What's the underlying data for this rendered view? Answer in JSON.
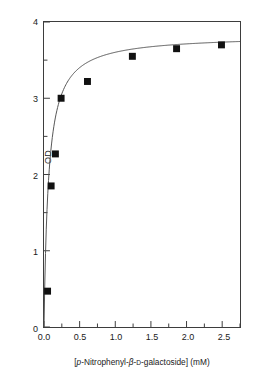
{
  "chart_data": {
    "type": "scatter",
    "title": "",
    "subtitle": "",
    "xlabel_parts": {
      "open_bracket": "[",
      "p_italic": "p",
      "nitrophenyl": "-Nitrophenyl-",
      "beta": "β",
      "dash1": "-",
      "d_smallcap": "D",
      "galactoside": "-galactoside]",
      "units": " (mM)"
    },
    "xlabel": "[p-Nitrophenyl-β-D-galactoside] (mM)",
    "ylabel": "OD",
    "xlim": [
      0.0,
      2.75
    ],
    "ylim": [
      0.0,
      4.0
    ],
    "xticks": [
      0.0,
      0.5,
      1.0,
      1.5,
      2.0,
      2.5
    ],
    "xtick_labels": [
      "0.0",
      "0.5",
      "1.0",
      "1.5",
      "2.0",
      "2.5"
    ],
    "x_minor_ticks": [
      0.25,
      0.75,
      1.25,
      1.75,
      2.25,
      2.75
    ],
    "yticks": [
      0,
      1,
      2,
      3,
      4
    ],
    "ytick_labels": [
      "0",
      "1",
      "2",
      "3",
      "4"
    ],
    "y_minor_ticks": [
      0.5,
      1.5,
      2.5,
      3.5
    ],
    "grid": false,
    "legend": false,
    "legend_position": "none",
    "marker_style": "filled-square",
    "marker_color": "#111111",
    "line_color": "#555555",
    "axis_color": "#3d3d3d",
    "background_color": "#ffffff",
    "x": [
      0.05,
      0.1,
      0.16,
      0.24,
      0.61,
      1.24,
      1.86,
      2.49
    ],
    "y": [
      0.47,
      1.85,
      2.27,
      3.0,
      3.22,
      3.55,
      3.65,
      3.7
    ],
    "series": [
      {
        "name": "OD",
        "x": [
          0.05,
          0.1,
          0.16,
          0.24,
          0.61,
          1.24,
          1.86,
          2.49
        ],
        "values": [
          0.47,
          1.85,
          2.27,
          3.0,
          3.22,
          3.55,
          3.65,
          3.7
        ]
      }
    ],
    "fit_model": "rectangular hyperbola (saturation / Michaelis-Menten form)",
    "fit_vmax": 3.83,
    "fit_km": 0.063,
    "annotations": []
  },
  "figure": {
    "caption": ""
  }
}
